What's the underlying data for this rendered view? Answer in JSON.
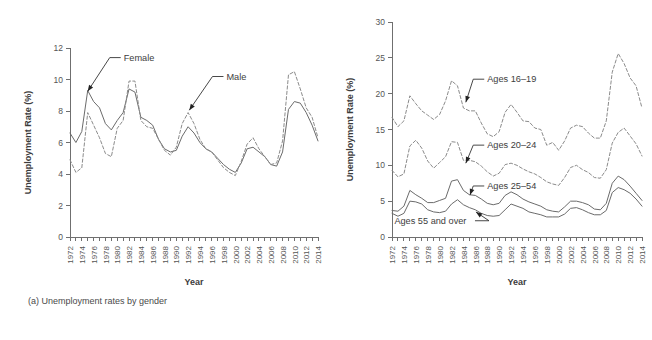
{
  "figure": {
    "panels": [
      {
        "id": "a",
        "caption": "(a) Unemployment rates by gender",
        "chart_data": {
          "type": "line",
          "title": "",
          "xlabel": "Year",
          "ylabel": "Unemployment Rate (%)",
          "xlim": [
            1972,
            2014
          ],
          "ylim": [
            0,
            12
          ],
          "yticks": [
            0,
            2,
            4,
            6,
            8,
            10,
            12
          ],
          "xticks_major": [
            1972,
            1974,
            1976,
            1978,
            1980,
            1982,
            1984,
            1986,
            1988,
            1990,
            1992,
            1994,
            1996,
            1998,
            2000,
            2002,
            2004,
            2006,
            2008,
            2010,
            2012,
            2014
          ],
          "xticks_minor_every": 1,
          "grid": false,
          "legend": "annotated-inline",
          "x": [
            1972,
            1973,
            1974,
            1975,
            1976,
            1977,
            1978,
            1979,
            1980,
            1981,
            1982,
            1983,
            1984,
            1985,
            1986,
            1987,
            1988,
            1989,
            1990,
            1991,
            1992,
            1993,
            1994,
            1995,
            1996,
            1997,
            1998,
            1999,
            2000,
            2001,
            2002,
            2003,
            2004,
            2005,
            2006,
            2007,
            2008,
            2009,
            2010,
            2011,
            2012,
            2013,
            2014
          ],
          "series": [
            {
              "name": "Female",
              "style": "solid",
              "values": [
                6.6,
                6.0,
                6.7,
                9.3,
                8.6,
                8.2,
                7.2,
                6.8,
                7.4,
                7.9,
                9.4,
                9.2,
                7.6,
                7.4,
                7.1,
                6.2,
                5.6,
                5.4,
                5.5,
                6.4,
                7.0,
                6.6,
                6.0,
                5.6,
                5.4,
                5.0,
                4.6,
                4.3,
                4.1,
                4.7,
                5.6,
                5.7,
                5.4,
                5.1,
                4.6,
                4.5,
                5.4,
                8.1,
                8.6,
                8.5,
                7.9,
                7.1,
                6.1
              ]
            },
            {
              "name": "Male",
              "style": "dashed",
              "values": [
                4.9,
                4.1,
                4.4,
                7.9,
                7.1,
                6.3,
                5.3,
                5.1,
                6.9,
                7.4,
                9.9,
                9.9,
                7.4,
                7.0,
                6.9,
                6.2,
                5.5,
                5.2,
                5.7,
                7.2,
                7.9,
                7.2,
                6.2,
                5.6,
                5.4,
                4.9,
                4.4,
                4.1,
                3.9,
                4.8,
                5.9,
                6.3,
                5.6,
                5.1,
                4.6,
                4.7,
                6.1,
                10.3,
                10.5,
                9.4,
                8.2,
                7.6,
                6.3
              ]
            }
          ],
          "annotations": [
            {
              "text": "Female",
              "label_x": 1981.1,
              "label_y": 11.2,
              "point_x": 1975.0,
              "point_y": 9.25
            },
            {
              "text": "Male",
              "label_x": 1998.5,
              "label_y": 10.0,
              "point_x": 1992.2,
              "point_y": 8.05
            }
          ]
        }
      },
      {
        "id": "b",
        "caption": "(b) Unemployment rates for women, by age",
        "chart_data": {
          "type": "line",
          "title": "",
          "xlabel": "Year",
          "ylabel": "Unemployment Rate (%)",
          "xlim": [
            1972,
            2014
          ],
          "ylim": [
            0,
            30
          ],
          "yticks": [
            0,
            5,
            10,
            15,
            20,
            25,
            30
          ],
          "xticks_major": [
            1972,
            1974,
            1976,
            1978,
            1980,
            1982,
            1984,
            1986,
            1988,
            1990,
            1992,
            1994,
            1996,
            1998,
            2000,
            2002,
            2004,
            2006,
            2008,
            2010,
            2012,
            2014
          ],
          "xticks_minor_every": 1,
          "grid": false,
          "legend": "annotated-inline",
          "x": [
            1972,
            1973,
            1974,
            1975,
            1976,
            1977,
            1978,
            1979,
            1980,
            1981,
            1982,
            1983,
            1984,
            1985,
            1986,
            1987,
            1988,
            1989,
            1990,
            1991,
            1992,
            1993,
            1994,
            1995,
            1996,
            1997,
            1998,
            1999,
            2000,
            2001,
            2002,
            2003,
            2004,
            2005,
            2006,
            2007,
            2008,
            2009,
            2010,
            2011,
            2012,
            2013,
            2014
          ],
          "series": [
            {
              "name": "Ages 16–19",
              "style": "dashed",
              "values": [
                16.7,
                15.4,
                16.2,
                19.7,
                18.6,
                17.6,
                17.0,
                16.4,
                17.1,
                19.0,
                21.8,
                21.1,
                18.0,
                17.6,
                17.6,
                15.9,
                14.4,
                14.0,
                14.7,
                17.4,
                18.5,
                17.4,
                16.2,
                16.1,
                15.2,
                15.0,
                12.8,
                13.2,
                12.1,
                13.4,
                15.2,
                15.6,
                15.4,
                14.5,
                13.8,
                13.8,
                16.2,
                23.0,
                25.6,
                24.2,
                22.2,
                21.1,
                18.0
              ]
            },
            {
              "name": "Ages 20–24",
              "style": "dashed",
              "values": [
                9.3,
                8.4,
                8.8,
                12.7,
                13.5,
                12.4,
                10.6,
                9.6,
                10.4,
                11.2,
                13.3,
                13.2,
                10.7,
                10.7,
                10.5,
                9.9,
                9.1,
                8.5,
                8.9,
                10.1,
                10.3,
                10.0,
                9.5,
                9.1,
                8.8,
                8.3,
                7.7,
                7.4,
                7.2,
                8.3,
                9.7,
                10.0,
                9.4,
                9.0,
                8.3,
                8.2,
                9.4,
                13.1,
                14.6,
                15.2,
                14.1,
                13.0,
                11.3
              ]
            },
            {
              "name": "Ages 25–54",
              "style": "solid",
              "values": [
                3.7,
                3.6,
                4.3,
                6.5,
                5.9,
                5.4,
                4.8,
                4.8,
                5.1,
                5.4,
                7.8,
                8.0,
                6.5,
                5.9,
                5.8,
                5.3,
                4.7,
                4.5,
                4.7,
                5.8,
                6.3,
                5.9,
                5.3,
                4.9,
                4.6,
                4.3,
                3.8,
                3.6,
                3.5,
                4.2,
                5.0,
                5.0,
                4.8,
                4.5,
                3.9,
                3.8,
                4.7,
                7.5,
                8.5,
                8.0,
                7.1,
                6.1,
                5.1
              ]
            },
            {
              "name": "Ages 55 and over",
              "style": "solid",
              "values": [
                3.3,
                2.9,
                3.3,
                5.0,
                4.9,
                4.6,
                3.8,
                3.5,
                3.4,
                3.6,
                4.6,
                5.2,
                4.5,
                4.1,
                3.8,
                3.3,
                3.0,
                2.9,
                3.0,
                3.8,
                4.6,
                4.3,
                4.0,
                3.5,
                3.3,
                3.1,
                2.8,
                2.8,
                2.8,
                3.2,
                4.0,
                4.1,
                3.8,
                3.4,
                3.1,
                3.1,
                3.7,
                6.2,
                6.9,
                6.6,
                6.1,
                5.3,
                4.3
              ]
            }
          ],
          "annotations": [
            {
              "text": "Ages 16–19",
              "label_x": 1988.0,
              "label_y": 21.6,
              "point_x": 1984.4,
              "point_y": 18.8
            },
            {
              "text": "Ages 20–24",
              "label_x": 1988.0,
              "label_y": 12.4,
              "point_x": 1984.4,
              "point_y": 10.3
            },
            {
              "text": "Ages 25–54",
              "label_x": 1988.0,
              "label_y": 6.7,
              "point_x": 1985.1,
              "point_y": 5.85
            },
            {
              "text": "Ages 55 and over",
              "label_x": 1972.4,
              "label_y": 1.85,
              "point_x": 1986.1,
              "point_y": 3.5,
              "align": "left-leader-right"
            }
          ]
        }
      }
    ]
  }
}
